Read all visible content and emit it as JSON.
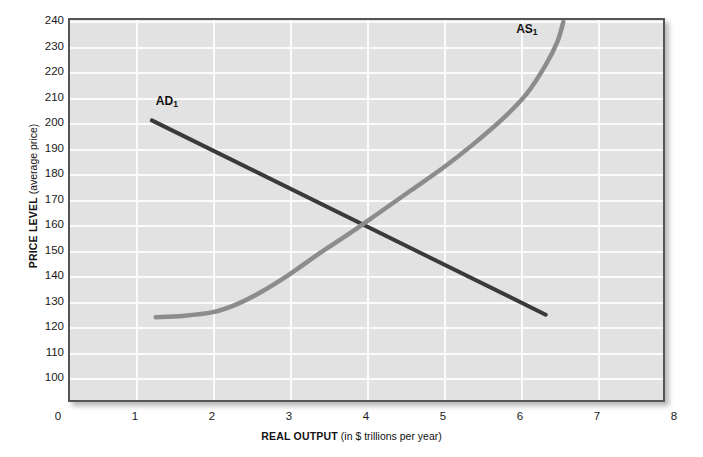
{
  "chart_data": {
    "type": "line",
    "title": "",
    "xlabel_bold": "REAL OUTPUT",
    "xlabel_light": "(in $ trillions per year)",
    "ylabel_bold": "PRICE LEVEL",
    "ylabel_light": "(average price)",
    "xlim": [
      0,
      8
    ],
    "ylim": [
      95,
      240
    ],
    "xticks": [
      0,
      1,
      2,
      3,
      4,
      5,
      6,
      7,
      8
    ],
    "xtick_labels": [
      "0",
      "1",
      "2",
      "3",
      "4",
      "5",
      "6",
      "7",
      "8"
    ],
    "yticks": [
      100,
      110,
      120,
      130,
      140,
      150,
      160,
      170,
      180,
      190,
      200,
      210,
      220,
      230,
      240
    ],
    "ytick_labels": [
      "100",
      "110",
      "120",
      "130",
      "140",
      "150",
      "160",
      "170",
      "180",
      "190",
      "200",
      "210",
      "220",
      "230",
      "240"
    ],
    "grid": true,
    "grid_color": "#fbfbfb",
    "plot_bg": "#e2e2e2",
    "legend_position": "inline-annotations",
    "series": [
      {
        "name": "AD1",
        "label_text": "AD",
        "label_sub": "1",
        "kind": "demand",
        "color": "#3a3a3a",
        "linewidth": 4,
        "points": [
          [
            1.2,
            201.0
          ],
          [
            6.35,
            124.0
          ]
        ],
        "annotation_x": 1.27,
        "annotation_y": 208.0
      },
      {
        "name": "AS1",
        "label_text": "AS",
        "label_sub": "1",
        "kind": "supply",
        "color": "#8c8c8c",
        "linewidth": 4.5,
        "points": [
          [
            1.25,
            123.0
          ],
          [
            1.6,
            123.5
          ],
          [
            2.0,
            125.0
          ],
          [
            2.3,
            128.0
          ],
          [
            2.6,
            132.5
          ],
          [
            3.0,
            140.0
          ],
          [
            3.4,
            148.5
          ],
          [
            3.8,
            156.5
          ],
          [
            4.2,
            165.0
          ],
          [
            4.6,
            173.5
          ],
          [
            5.0,
            182.0
          ],
          [
            5.4,
            191.5
          ],
          [
            5.8,
            202.0
          ],
          [
            6.1,
            211.5
          ],
          [
            6.35,
            223.0
          ],
          [
            6.5,
            232.0
          ],
          [
            6.58,
            240.0
          ]
        ],
        "annotation_x": 5.95,
        "annotation_y": 236.0
      }
    ],
    "equilibrium": {
      "x": 4.0,
      "y": 160.0,
      "marked": false
    }
  }
}
